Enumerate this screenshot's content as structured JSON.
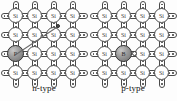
{
  "figure": {
    "title": "",
    "background_color": "#fdfdfd",
    "atom_outline_color": "#4a4a4a",
    "dopant_fill_color": "#8f8f8f",
    "carrier_color": "#4f4f4f"
  },
  "panels": [
    {
      "id": "n-type",
      "caption": "n-type",
      "host_symbol": "Si",
      "lattice": {
        "rows": 4,
        "cols": 4,
        "atom_labels": [
          [
            "Si",
            "Si",
            "Si",
            "Si"
          ],
          [
            "Si",
            "Si",
            "Si",
            "Si"
          ],
          [
            "Si",
            "Si",
            "Si",
            "Si"
          ],
          [
            "Si",
            "Si",
            "Si",
            "Si"
          ]
        ]
      },
      "dopant": {
        "symbol": "P",
        "row": 2,
        "col": 0,
        "kind": "donor"
      },
      "carrier": {
        "kind": "free-electron",
        "symbol": "e-",
        "row": 1,
        "col": 2
      }
    },
    {
      "id": "p-type",
      "caption": "p-type",
      "host_symbol": "Si",
      "lattice": {
        "rows": 4,
        "cols": 4,
        "atom_labels": [
          [
            "Si",
            "Si",
            "Si",
            "Si"
          ],
          [
            "Si",
            "Si",
            "Si",
            "Si"
          ],
          [
            "Si",
            "Si",
            "Si",
            "Si"
          ],
          [
            "Si",
            "Si",
            "Si",
            "Si"
          ]
        ]
      },
      "dopant": {
        "symbol": "B",
        "row": 2,
        "col": 1,
        "kind": "acceptor"
      },
      "carrier": {
        "kind": "hole",
        "symbol": "",
        "row": 2,
        "col": 1
      }
    }
  ]
}
